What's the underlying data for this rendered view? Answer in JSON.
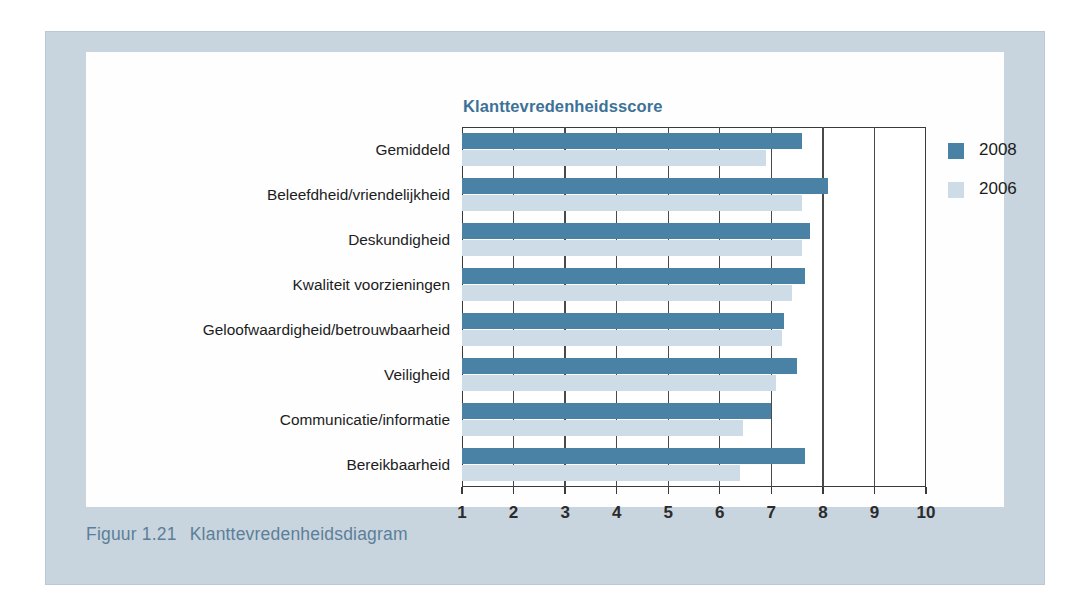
{
  "figure": {
    "caption_number": "Figuur 1.21",
    "caption_text": "Klanttevredenheidsdiagram",
    "panel_color": "#c8d4de",
    "caption_color": "#5c7f99"
  },
  "chart_data": {
    "type": "bar",
    "orientation": "horizontal",
    "title": "Klanttevredenheidsscore",
    "xlabel": "",
    "ylabel": "",
    "xlim": [
      1,
      10
    ],
    "xticks": [
      1,
      2,
      3,
      4,
      5,
      6,
      7,
      8,
      9,
      10
    ],
    "xtick_labels": [
      "1",
      "2",
      "3",
      "4",
      "5",
      "6",
      "7",
      "8",
      "9",
      "10"
    ],
    "grid": true,
    "legend_position": "right",
    "categories": [
      "Gemiddeld",
      "Beleefdheid/vriendelijkheid",
      "Deskundigheid",
      "Kwaliteit voorzieningen",
      "Geloofwaardigheid/betrouwbaarheid",
      "Veiligheid",
      "Communicatie/informatie",
      "Bereikbaarheid"
    ],
    "series": [
      {
        "name": "2008",
        "color": "#4a82a6",
        "values": [
          7.6,
          8.1,
          7.75,
          7.65,
          7.25,
          7.5,
          7.0,
          7.65
        ]
      },
      {
        "name": "2006",
        "color": "#cddce7",
        "values": [
          6.9,
          7.6,
          7.6,
          7.4,
          7.2,
          7.1,
          6.45,
          6.4
        ]
      }
    ]
  },
  "legend": {
    "entries": [
      {
        "label": "2008",
        "color": "#4a82a6"
      },
      {
        "label": "2006",
        "color": "#cddce7"
      }
    ]
  }
}
